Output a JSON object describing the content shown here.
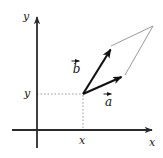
{
  "figure": {
    "kind": "vector-addition-parallelogram-diagram",
    "width": 163,
    "height": 158,
    "background_color": "#ffffff",
    "axis_color": "#2b2b2b",
    "vector_color": "#111111",
    "thin_line_color": "#8d8d8d",
    "dashed_line_color": "#9a9a9a",
    "label_color": "#1a1a1a"
  },
  "axes": {
    "y_axis_label": "y",
    "x_axis_label": "x",
    "origin_px": {
      "x": 37,
      "y": 130
    },
    "y_axis_top_px": 14,
    "y_axis_bottom_px": 148,
    "x_axis_left_px": 12,
    "x_axis_right_px": 157
  },
  "ticks": {
    "y_tick_label": "y",
    "y_tick_value_px": 94,
    "x_tick_label": "x",
    "x_tick_value_px": 83
  },
  "vectors": [
    {
      "name": "a",
      "label": "a",
      "style": "bold-arrow",
      "tail_px": {
        "x": 83,
        "y": 94
      },
      "head_px": {
        "x": 126,
        "y": 75
      },
      "label_px": {
        "x": 106,
        "y": 93
      }
    },
    {
      "name": "b",
      "label": "b",
      "style": "bold-arrow",
      "tail_px": {
        "x": 83,
        "y": 94
      },
      "head_px": {
        "x": 112,
        "y": 46
      },
      "label_px": {
        "x": 75,
        "y": 60
      }
    }
  ],
  "parallelogram": {
    "vertex_px": {
      "x": 83,
      "y": 94
    },
    "far_corner_px": {
      "x": 153,
      "y": 26
    },
    "thin_side_from_b_head": {
      "x1": 112,
      "y1": 46,
      "x2": 153,
      "y2": 26
    },
    "thin_side_from_a_head": {
      "x1": 126,
      "y1": 75,
      "x2": 153,
      "y2": 26
    }
  },
  "dashed_guides": {
    "horizontal": {
      "x1": 37,
      "y1": 94,
      "x2": 83,
      "y2": 94
    },
    "vertical": {
      "x1": 83,
      "y1": 94,
      "x2": 83,
      "y2": 130
    }
  }
}
